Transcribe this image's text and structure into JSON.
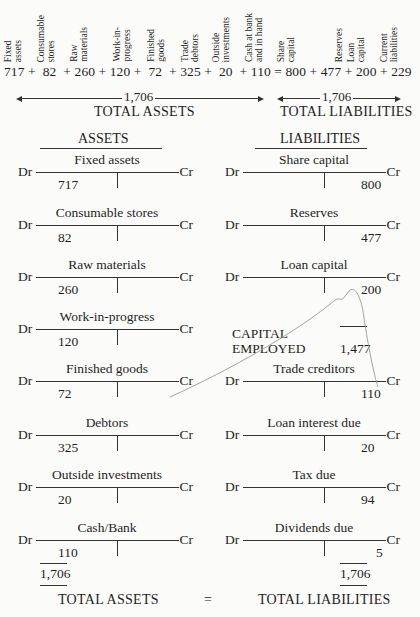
{
  "equation": {
    "column_labels": [
      {
        "label": "Fixed\nassets",
        "value": "717"
      },
      {
        "label": "Consumable\nstores",
        "value": "82"
      },
      {
        "label": "Raw\nmaterials",
        "value": "260"
      },
      {
        "label": "Work-in-\nprogress",
        "value": "120"
      },
      {
        "label": "Finished\ngoods",
        "value": "72"
      },
      {
        "label": "Trade\ndebtors",
        "value": "325"
      },
      {
        "label": "Outside\ninvestments",
        "value": "20"
      },
      {
        "label": "Cash at bank\nand in hand",
        "value": "110"
      },
      {
        "label": "Share\ncapital",
        "value": "800"
      },
      {
        "label": "Reserves",
        "value": "477"
      },
      {
        "label": "Loan\ncapital",
        "value": "200"
      },
      {
        "label": "Current\nliabilities",
        "value": "229"
      }
    ],
    "line": "717 +  82  + 260 + 120 +  72  + 325 +  20  + 110 = 800 + 477 + 200 + 229",
    "assets_total": "1,706",
    "liabilities_total": "1,706",
    "assets_caption": "TOTAL ASSETS",
    "liabilities_caption": "TOTAL LIABILITIES"
  },
  "assets": {
    "heading": "ASSETS",
    "accounts": [
      {
        "title": "Fixed assets",
        "debit": "717",
        "credit": ""
      },
      {
        "title": "Consumable stores",
        "debit": "82",
        "credit": ""
      },
      {
        "title": "Raw materials",
        "debit": "260",
        "credit": ""
      },
      {
        "title": "Work-in-progress",
        "debit": "120",
        "credit": ""
      },
      {
        "title": "Finished goods",
        "debit": "72",
        "credit": ""
      },
      {
        "title": "Debtors",
        "debit": "325",
        "credit": ""
      },
      {
        "title": "Outside investments",
        "debit": "20",
        "credit": ""
      },
      {
        "title": "Cash/Bank",
        "debit": "110",
        "credit": ""
      }
    ],
    "total": "1,706",
    "caption": "TOTAL ASSETS"
  },
  "liabilities": {
    "heading": "LIABILITIES",
    "accounts": [
      {
        "title": "Share capital",
        "debit": "",
        "credit": "800"
      },
      {
        "title": "Reserves",
        "debit": "",
        "credit": "477"
      },
      {
        "title": "Loan capital",
        "debit": "",
        "credit": "200"
      },
      {
        "title": "Trade creditors",
        "debit": "",
        "credit": "110"
      },
      {
        "title": "Loan interest due",
        "debit": "",
        "credit": "20"
      },
      {
        "title": "Tax due",
        "debit": "",
        "credit": "94"
      },
      {
        "title": "Dividends due",
        "debit": "",
        "credit": "5"
      }
    ],
    "capital_employed_label_1": "CAPITAL",
    "capital_employed_label_2": "EMPLOYED",
    "capital_employed_value": "1,477",
    "total": "1,706",
    "caption": "TOTAL LIABILITIES"
  },
  "footer": {
    "left": "TOTAL ASSETS",
    "equals": "=",
    "right": "TOTAL LIABILITIES"
  },
  "labels": {
    "dr": "Dr",
    "cr": "Cr"
  }
}
